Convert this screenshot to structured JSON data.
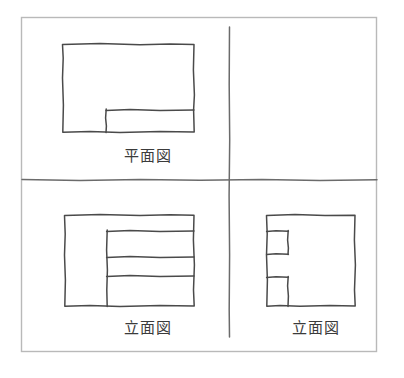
{
  "sheet": {
    "title": "orthographic-projection-sketch",
    "background_color": "#ffffff",
    "border_color": "#b9b9b9",
    "ink_color": "#4a4a4a",
    "divider_color": "#6b6b6b"
  },
  "labels": {
    "plan": "平面図",
    "elevation_front": "立面図",
    "elevation_side": "立面図"
  },
  "views": {
    "plan": {
      "name": "plan-view",
      "label": "平面図",
      "quadrant": "top-left",
      "outline": {
        "x": 62,
        "y": 44,
        "width": 132,
        "height": 88
      },
      "interior_lines": [
        {
          "type": "horizontal",
          "x1": 106,
          "y1": 110,
          "x2": 194,
          "y2": 110
        },
        {
          "type": "vertical",
          "x1": 106,
          "y1": 110,
          "x2": 106,
          "y2": 132
        }
      ]
    },
    "elevation_front": {
      "name": "front-elevation-view",
      "label": "立面図",
      "quadrant": "bottom-left",
      "outline": {
        "x": 64,
        "y": 215,
        "width": 130,
        "height": 91
      },
      "interior_lines": [
        {
          "type": "vertical",
          "x1": 107,
          "y1": 231,
          "x2": 107,
          "y2": 306
        },
        {
          "type": "horizontal",
          "x1": 107,
          "y1": 231,
          "x2": 194,
          "y2": 231
        },
        {
          "type": "horizontal",
          "x1": 107,
          "y1": 257,
          "x2": 194,
          "y2": 257
        },
        {
          "type": "horizontal",
          "x1": 107,
          "y1": 276,
          "x2": 194,
          "y2": 276
        }
      ]
    },
    "elevation_side": {
      "name": "side-elevation-view",
      "label": "立面図",
      "quadrant": "bottom-right",
      "outline": {
        "x": 266,
        "y": 215,
        "width": 89,
        "height": 91
      },
      "interior_lines": [
        {
          "type": "vertical",
          "x1": 288,
          "y1": 231,
          "x2": 288,
          "y2": 254
        },
        {
          "type": "horizontal",
          "x1": 266,
          "y1": 231,
          "x2": 288,
          "y2": 231
        },
        {
          "type": "horizontal",
          "x1": 266,
          "y1": 254,
          "x2": 288,
          "y2": 254
        },
        {
          "type": "vertical",
          "x1": 288,
          "y1": 277,
          "x2": 288,
          "y2": 306
        },
        {
          "type": "horizontal",
          "x1": 266,
          "y1": 277,
          "x2": 288,
          "y2": 277
        }
      ]
    }
  },
  "dividers": {
    "vertical": {
      "x": 229,
      "y1": 27,
      "y2": 337
    },
    "horizontal": {
      "y": 180,
      "x1": 22,
      "x2": 377
    }
  },
  "frame": {
    "x": 21,
    "y": 17,
    "width": 356,
    "height": 335
  }
}
